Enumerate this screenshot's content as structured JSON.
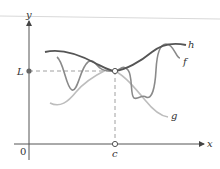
{
  "figure": {
    "axes": {
      "x_label": "x",
      "y_label": "y",
      "origin_label": "0"
    },
    "points": {
      "limit_label": "L",
      "c_label": "c"
    },
    "curves": [
      {
        "name": "h",
        "label": "h",
        "color": "#555555"
      },
      {
        "name": "f",
        "label": "f",
        "color": "#8a8a8a"
      },
      {
        "name": "g",
        "label": "g",
        "color": "#bdbdbd"
      }
    ],
    "colors": {
      "axis": "#555555",
      "dashed": "#888888",
      "top_rule": "#d8d8d8"
    }
  }
}
